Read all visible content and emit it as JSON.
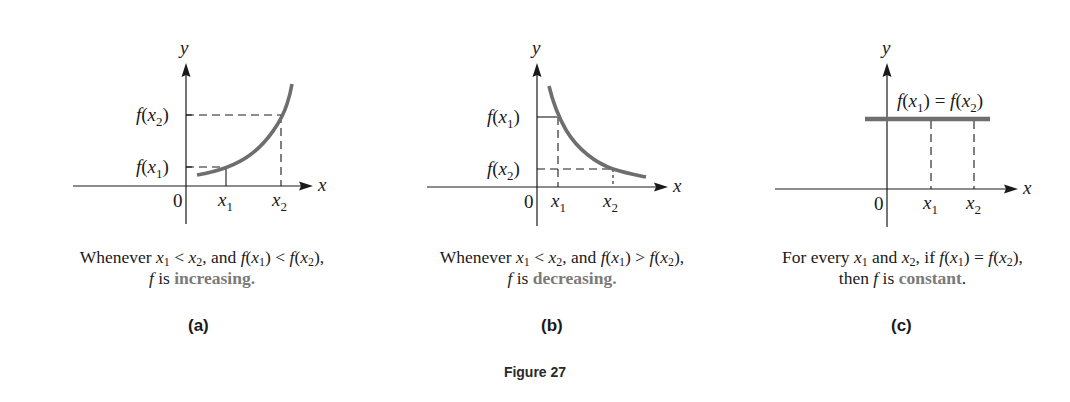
{
  "figure": {
    "title": "Figure 27"
  },
  "panels": [
    {
      "id": "a",
      "label": "(a)",
      "axis_y": "y",
      "axis_x": "x",
      "origin": "0",
      "tick_x1": "x",
      "tick_x1_sub": "1",
      "tick_x2": "x",
      "tick_x2_sub": "2",
      "y_label_top": {
        "f": "f",
        "open": "(",
        "x": "x",
        "sub": "2",
        "close": ")"
      },
      "y_label_bottom": {
        "f": "f",
        "open": "(",
        "x": "x",
        "sub": "1",
        "close": ")"
      },
      "caption_line1": {
        "pre": "Whenever ",
        "x1": "x",
        "s1": "1",
        "op1": " < ",
        "x2": "x",
        "s2": "2",
        "mid": ", and ",
        "f1": "f",
        "a1": "(",
        "fx1": "x",
        "fs1": "1",
        "b1": ")",
        "op2": " < ",
        "f2": "f",
        "a2": "(",
        "fx2": "x",
        "fs2": "2",
        "b2": "),",
        "end": ""
      },
      "caption_line2": {
        "f": "f",
        "is": " is ",
        "keyword": "increasing",
        "end": "."
      }
    },
    {
      "id": "b",
      "label": "(b)",
      "axis_y": "y",
      "axis_x": "x",
      "origin": "0",
      "tick_x1": "x",
      "tick_x1_sub": "1",
      "tick_x2": "x",
      "tick_x2_sub": "2",
      "y_label_top": {
        "f": "f",
        "open": "(",
        "x": "x",
        "sub": "1",
        "close": ")"
      },
      "y_label_bottom": {
        "f": "f",
        "open": "(",
        "x": "x",
        "sub": "2",
        "close": ")"
      },
      "caption_line1": {
        "pre": "Whenever ",
        "x1": "x",
        "s1": "1",
        "op1": " < ",
        "x2": "x",
        "s2": "2",
        "mid": ", and ",
        "f1": "f",
        "a1": "(",
        "fx1": "x",
        "fs1": "1",
        "b1": ")",
        "op2": " > ",
        "f2": "f",
        "a2": "(",
        "fx2": "x",
        "fs2": "2",
        "b2": "),",
        "end": ""
      },
      "caption_line2": {
        "f": "f",
        "is": " is ",
        "keyword": "decreasing",
        "end": "."
      }
    },
    {
      "id": "c",
      "label": "(c)",
      "axis_y": "y",
      "axis_x": "x",
      "origin": "0",
      "tick_x1": "x",
      "tick_x1_sub": "1",
      "tick_x2": "x",
      "tick_x2_sub": "2",
      "line_label": {
        "f1": "f",
        "a1": "(",
        "x1": "x",
        "s1": "1",
        "b1": ")",
        "eq": " = ",
        "f2": "f",
        "a2": "(",
        "x2": "x",
        "s2": "2",
        "b2": ")"
      },
      "caption_line1": {
        "pre": "For every ",
        "x1": "x",
        "s1": "1",
        "and": " and ",
        "x2": "x",
        "s2": "2",
        "mid": ", if ",
        "f1": "f",
        "a1": "(",
        "fx1": "x",
        "fs1": "1",
        "b1": ")",
        "op": " = ",
        "f2": "f",
        "a2": "(",
        "fx2": "x",
        "fs2": "2",
        "b2": "),",
        "end": ""
      },
      "caption_line2": {
        "then": "then ",
        "f": "f",
        "is": " is ",
        "keyword": "constant",
        "end": "."
      }
    }
  ],
  "colors": {
    "curve": "#6e6e6e",
    "keyword": "#7a7a7a",
    "ink": "#1a1a1a"
  }
}
